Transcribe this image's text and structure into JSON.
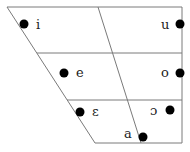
{
  "diagram": {
    "vowels": [
      {
        "symbol": "i",
        "name": "close-front"
      },
      {
        "symbol": "u",
        "name": "close-back"
      },
      {
        "symbol": "e",
        "name": "close-mid-front"
      },
      {
        "symbol": "o",
        "name": "close-mid-back"
      },
      {
        "symbol": "ɛ",
        "name": "open-mid-front"
      },
      {
        "symbol": "ɔ",
        "name": "open-mid-back"
      },
      {
        "symbol": "a",
        "name": "open-central"
      }
    ],
    "colors": {
      "line": "#7a7a7a",
      "dot": "#000000",
      "text": "#222222"
    }
  }
}
